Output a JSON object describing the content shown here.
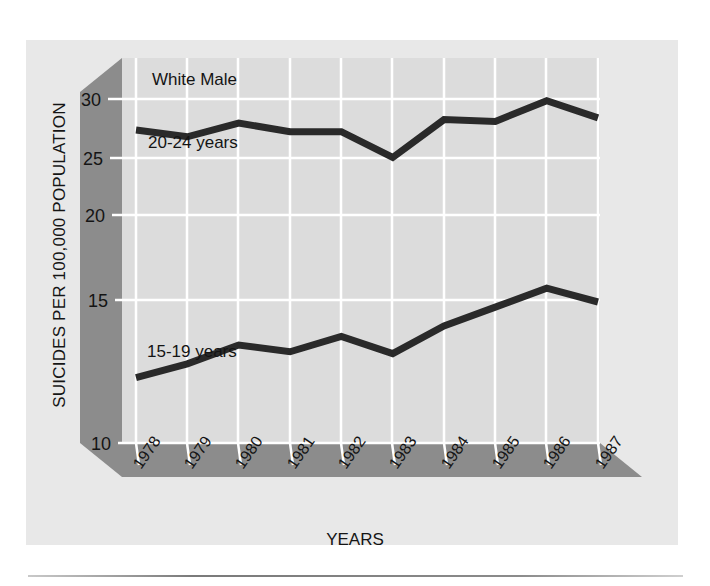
{
  "figure": {
    "background_color": "#ffffff",
    "panel_color": "#e8e8e8",
    "plot_color": "#dcdcdc",
    "axis_band_color": "#8c8c8c",
    "grid_color": "#ffffff",
    "line_color": "#2a2a2a"
  },
  "chart_data": {
    "type": "line",
    "title": "White Male",
    "xlabel": "YEARS",
    "ylabel": "SUICIDES PER 100,000 POPULATION",
    "categories": [
      "1978",
      "1979",
      "1980",
      "1981",
      "1982",
      "1983",
      "1984",
      "1985",
      "1986",
      "1987"
    ],
    "x": [
      1978,
      1979,
      1980,
      1981,
      1982,
      1983,
      1984,
      1985,
      1986,
      1987
    ],
    "ylim": [
      8.5,
      31.5
    ],
    "yticks": [
      10,
      15,
      20,
      25,
      30
    ],
    "ytick_labels": [
      "10",
      "15",
      "20",
      "25",
      "30"
    ],
    "grid": true,
    "legend": "inline-annotations",
    "series": [
      {
        "name": "20-24 years",
        "label": "20-24 years",
        "values": [
          28.2,
          27.8,
          28.6,
          28.1,
          28.1,
          26.6,
          28.8,
          28.7,
          29.9,
          28.9
        ]
      },
      {
        "name": "15-19 years",
        "label": "15-19 years",
        "values": [
          13.8,
          14.6,
          15.7,
          15.3,
          16.2,
          15.2,
          16.8,
          17.9,
          19.0,
          18.2
        ]
      }
    ],
    "annotations": [
      {
        "text": "White Male",
        "x": 1978.3,
        "y": 31.0
      },
      {
        "text": "20-24 years",
        "x": 1978.2,
        "y": 25.6
      },
      {
        "text": "15-19 years",
        "x": 1978.2,
        "y": 12.3
      }
    ]
  }
}
